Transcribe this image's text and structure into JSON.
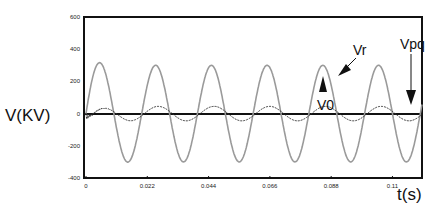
{
  "chart_data": {
    "type": "line",
    "title": "",
    "xlabel": "t(s)",
    "ylabel": "V(KV)",
    "xlim": [
      0,
      0.1206
    ],
    "ylim": [
      -400,
      600
    ],
    "x_ticks": [
      "0",
      "0.022",
      "0.044",
      "0.066",
      "0.088",
      "0.11"
    ],
    "y_ticks": [
      "600",
      "400",
      "200",
      "0",
      "-200",
      "-400"
    ],
    "grid": false,
    "legend": "annotations",
    "annotations": [
      {
        "text": "Vr",
        "points_to": "Vr peak near t=0.088"
      },
      {
        "text": "Vpq",
        "points_to": "Vpq curve near t=0.118"
      },
      {
        "text": "V0",
        "points_to": "Vr peak at t=0.088 (arrow up)"
      }
    ],
    "series": [
      {
        "name": "Vr",
        "description": "sinusoid, 50 Hz, amplitude ~300 kV, initial transient overshoot to ~350 kV at t~0.005",
        "x": [
          0,
          0.005,
          0.01,
          0.015,
          0.02,
          0.025,
          0.03,
          0.035,
          0.04,
          0.045,
          0.05,
          0.055,
          0.06,
          0.065,
          0.07,
          0.075,
          0.08,
          0.085,
          0.09,
          0.095,
          0.1,
          0.105,
          0.11,
          0.115,
          0.12
        ],
        "values": [
          0,
          350,
          0,
          -300,
          0,
          300,
          0,
          -300,
          0,
          300,
          0,
          -300,
          0,
          300,
          0,
          -300,
          0,
          300,
          0,
          -300,
          0,
          300,
          0,
          -300,
          0
        ]
      },
      {
        "name": "Vpq",
        "description": "small sinusoid ~40-50 kV amplitude, 50 Hz, phase-shifted; high-frequency oscillation near t=0 down to ~-80 kV",
        "x": [
          0,
          0.003,
          0.01,
          0.015,
          0.02,
          0.025,
          0.03,
          0.035,
          0.04,
          0.045,
          0.05,
          0.055,
          0.06,
          0.065,
          0.07,
          0.075,
          0.08,
          0.085,
          0.09,
          0.095,
          0.1,
          0.105,
          0.11,
          0.115,
          0.12
        ],
        "values": [
          0,
          -70,
          45,
          0,
          -45,
          0,
          45,
          0,
          -45,
          0,
          45,
          0,
          -45,
          0,
          45,
          0,
          -45,
          0,
          45,
          0,
          -45,
          0,
          45,
          0,
          -45
        ]
      }
    ]
  }
}
